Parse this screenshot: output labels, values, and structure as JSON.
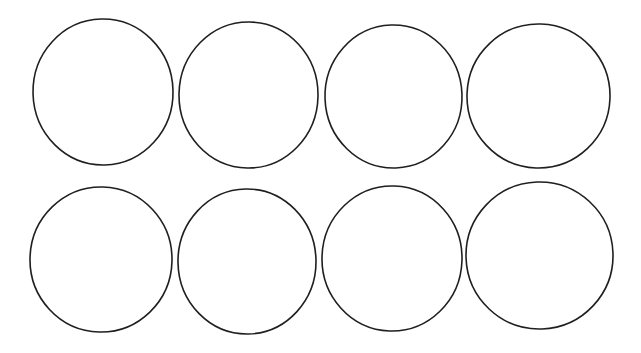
{
  "page": {
    "kind": "blank-circle-template",
    "width": 641,
    "height": 353,
    "background_color": "#ffffff",
    "visible_text": ""
  },
  "style": {
    "stroke_color": "#1f1f1f",
    "stroke_width": 1.6,
    "fill_color": "none",
    "rows": 2,
    "columns": 4,
    "total_circles": 8
  },
  "chart_data": {
    "type": "scatter",
    "title": "",
    "subtitle": "",
    "xlabel": "",
    "ylabel": "",
    "xlim": [
      0,
      641
    ],
    "ylim": [
      0,
      353
    ],
    "grid": false,
    "legend": "none",
    "annotations": [],
    "categories": [
      "row-1-col-1",
      "row-1-col-2",
      "row-1-col-3",
      "row-1-col-4",
      "row-2-col-1",
      "row-2-col-2",
      "row-2-col-3",
      "row-2-col-4"
    ],
    "series": [
      {
        "name": "circle-outlines",
        "values": [
          {
            "id": "circle-1",
            "row": 1,
            "col": 1,
            "cx": 103.0,
            "cy": 92.0,
            "rx": 70.0,
            "ry": 73.0,
            "rotate": -1.5
          },
          {
            "id": "circle-2",
            "row": 1,
            "col": 2,
            "cx": 248.5,
            "cy": 95.0,
            "rx": 69.5,
            "ry": 73.0,
            "rotate": 1.0
          },
          {
            "id": "circle-3",
            "row": 1,
            "col": 3,
            "cx": 393.5,
            "cy": 96.5,
            "rx": 68.5,
            "ry": 71.5,
            "rotate": -2.0
          },
          {
            "id": "circle-4",
            "row": 1,
            "col": 4,
            "cx": 538.5,
            "cy": 96.0,
            "rx": 71.5,
            "ry": 72.0,
            "rotate": 2.0
          },
          {
            "id": "circle-5",
            "row": 2,
            "col": 1,
            "cx": 101.0,
            "cy": 259.5,
            "rx": 71.0,
            "ry": 72.5,
            "rotate": 1.5
          },
          {
            "id": "circle-6",
            "row": 2,
            "col": 2,
            "cx": 247.0,
            "cy": 261.5,
            "rx": 69.0,
            "ry": 72.5,
            "rotate": -1.0
          },
          {
            "id": "circle-7",
            "row": 2,
            "col": 3,
            "cx": 392.0,
            "cy": 258.5,
            "rx": 70.0,
            "ry": 72.5,
            "rotate": 2.0
          },
          {
            "id": "circle-8",
            "row": 2,
            "col": 4,
            "cx": 539.5,
            "cy": 255.5,
            "rx": 73.5,
            "ry": 73.5,
            "rotate": -2.0
          }
        ]
      }
    ]
  }
}
